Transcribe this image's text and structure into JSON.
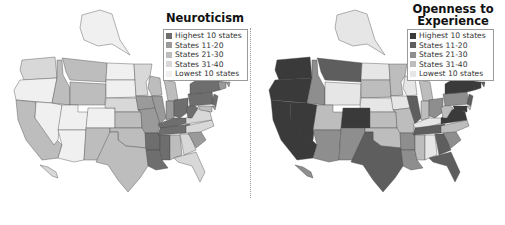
{
  "chart_data": [
    {
      "type": "choropleth",
      "title": "Neuroticism",
      "legend": [
        {
          "label": "Highest 10 states",
          "color": "#6e6e6e"
        },
        {
          "label": "States 11-20",
          "color": "#9a9a9a"
        },
        {
          "label": "States 21-30",
          "color": "#bdbdbd"
        },
        {
          "label": "States 31-40",
          "color": "#d8d8d8"
        },
        {
          "label": "Lowest 10 states",
          "color": "#f0f0f0"
        }
      ],
      "bins": {
        "Highest 10 states": [
          "NY",
          "PA",
          "OH",
          "WV",
          "KY",
          "TN",
          "AR",
          "LA",
          "MS",
          "NJ"
        ],
        "States 11-20": [
          "IL",
          "IN",
          "MO",
          "IA",
          "SC",
          "RI",
          "CT",
          "MA",
          "DE",
          "ME"
        ],
        "States 21-30": [
          "CA",
          "WY",
          "MT",
          "ID",
          "MI",
          "WI",
          "KS",
          "OK",
          "NM",
          "TX",
          "AL",
          "VT",
          "NH",
          "MD"
        ],
        "States 31-40": [
          "WA",
          "MN",
          "NE",
          "GA",
          "VA",
          "NC",
          "FL",
          "HI"
        ],
        "Lowest 10 states": [
          "OR",
          "NV",
          "UT",
          "AZ",
          "CO",
          "ND",
          "SD",
          "AK"
        ]
      }
    },
    {
      "type": "choropleth",
      "title": "Openness to Experience",
      "legend": [
        {
          "label": "Highest 10 states",
          "color": "#3a3a3a"
        },
        {
          "label": "States 11-20",
          "color": "#5e5e5e"
        },
        {
          "label": "States 21-30",
          "color": "#8e8e8e"
        },
        {
          "label": "States 31-40",
          "color": "#bdbdbd"
        },
        {
          "label": "Lowest 10 states",
          "color": "#e6e6e6"
        }
      ],
      "bins": {
        "Highest 10 states": [
          "WA",
          "OR",
          "CA",
          "NV",
          "CO",
          "VA",
          "MD",
          "NY",
          "MA",
          "VT",
          "CT"
        ],
        "States 11-20": [
          "MT",
          "IL",
          "TX",
          "GA",
          "FL",
          "TN",
          "NJ",
          "NH",
          "RI"
        ],
        "States 21-30": [
          "ID",
          "AZ",
          "NM",
          "AR",
          "LA",
          "SC",
          "OH",
          "ME",
          "PA",
          "HI"
        ],
        "States 31-40": [
          "UT",
          "SD",
          "KS",
          "MO",
          "MN",
          "MI",
          "IN",
          "MS",
          "OK",
          "NC",
          "WV",
          "DE"
        ],
        "Lowest 10 states": [
          "WY",
          "ND",
          "NE",
          "IA",
          "WI",
          "KY",
          "AL",
          "AK"
        ]
      }
    }
  ],
  "maps": {
    "left": {
      "title": "Neuroticism"
    },
    "right": {
      "title": "Openness to Experience"
    }
  }
}
